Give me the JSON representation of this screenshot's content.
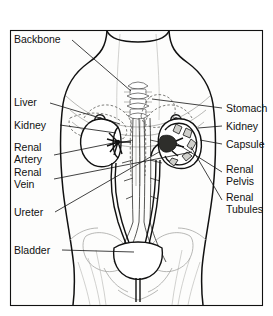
{
  "figure": {
    "orientation": "anterior view of female torso",
    "style": "line drawing, black on white"
  },
  "labels_left": [
    {
      "id": "backbone",
      "text": "Backbone",
      "lines": [
        "Backbone"
      ],
      "x": 14,
      "y": 43,
      "anchor_x": 128,
      "anchor_y": 88
    },
    {
      "id": "liver",
      "text": "Liver",
      "lines": [
        "Liver"
      ],
      "x": 14,
      "y": 106,
      "anchor_x": 118,
      "anchor_y": 86
    },
    {
      "id": "kidney-left",
      "text": "Kidney",
      "lines": [
        "Kidney"
      ],
      "x": 14,
      "y": 129,
      "anchor_x": 135,
      "anchor_y": 128
    },
    {
      "id": "renal-artery",
      "text": "Renal Artery",
      "lines": [
        "Renal",
        "Artery"
      ],
      "x": 14,
      "y": 151,
      "anchor_x": 132,
      "anchor_y": 152
    },
    {
      "id": "renal-vein",
      "text": "Renal Vein",
      "lines": [
        "Renal",
        "Vein"
      ],
      "x": 14,
      "y": 176,
      "anchor_x": 190,
      "anchor_y": 156
    },
    {
      "id": "ureter",
      "text": "Ureter",
      "lines": [
        "Ureter"
      ],
      "x": 14,
      "y": 216,
      "anchor_x": 185,
      "anchor_y": 150
    },
    {
      "id": "bladder",
      "text": "Bladder",
      "lines": [
        "Bladder"
      ],
      "x": 14,
      "y": 254,
      "anchor_x": 140,
      "anchor_y": 252
    }
  ],
  "labels_right": [
    {
      "id": "stomach",
      "text": "Stomach",
      "lines": [
        "Stomach"
      ],
      "x": 226,
      "y": 112,
      "anchor_x": 150,
      "anchor_y": 97
    },
    {
      "id": "kidney-right",
      "text": "Kidney",
      "lines": [
        "Kidney"
      ],
      "x": 226,
      "y": 130,
      "anchor_x": 188,
      "anchor_y": 128
    },
    {
      "id": "capsule",
      "text": "Capsule",
      "lines": [
        "Capsule"
      ],
      "x": 226,
      "y": 148,
      "anchor_x": 196,
      "anchor_y": 139
    },
    {
      "id": "renal-pelvis",
      "text": "Renal Pelvis",
      "lines": [
        "Renal",
        "Pelvis"
      ],
      "x": 226,
      "y": 173,
      "anchor_x": 176,
      "anchor_y": 140
    },
    {
      "id": "renal-tubules",
      "text": "Renal Tubules",
      "lines": [
        "Renal",
        "Tubules"
      ],
      "x": 226,
      "y": 201,
      "anchor_x": 190,
      "anchor_y": 146
    }
  ],
  "colors": {
    "ink": "#111111",
    "paper": "#fdfdfc",
    "faint": "#9a9a96",
    "medulla": "#cfcfcb"
  }
}
